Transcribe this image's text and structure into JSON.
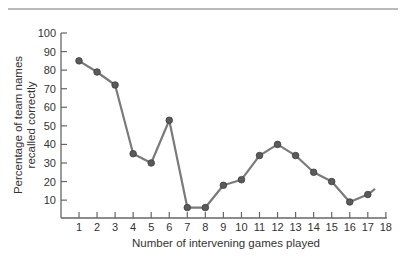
{
  "chart_data": {
    "type": "line",
    "title": "",
    "xlabel": "Number of intervening games played",
    "ylabel_lines": [
      "Percentage of team names",
      "recalled correctly"
    ],
    "ylabel": "Percentage of team names recalled correctly",
    "x": [
      1,
      2,
      3,
      4,
      5,
      6,
      7,
      8,
      9,
      10,
      11,
      12,
      13,
      14,
      15,
      16,
      17
    ],
    "values": [
      85,
      79,
      72,
      35,
      30,
      53,
      6,
      6,
      18,
      21,
      34,
      40,
      34,
      25,
      20,
      9,
      13
    ],
    "tail_end": {
      "x": 17.4,
      "y": 16
    },
    "x_ticks": [
      "1",
      "2",
      "3",
      "4",
      "5",
      "6",
      "7",
      "8",
      "9",
      "10",
      "11",
      "12",
      "13",
      "14",
      "15",
      "16",
      "17",
      "18"
    ],
    "y_ticks": [
      "10",
      "20",
      "30",
      "40",
      "50",
      "60",
      "70",
      "80",
      "90",
      "100"
    ],
    "xlim": [
      0,
      18
    ],
    "ylim": [
      0,
      100
    ],
    "grid": false,
    "legend": null,
    "colors": {
      "line": "#7a7a7a",
      "marker": "#5a5a5a",
      "axis": "#666666"
    }
  }
}
